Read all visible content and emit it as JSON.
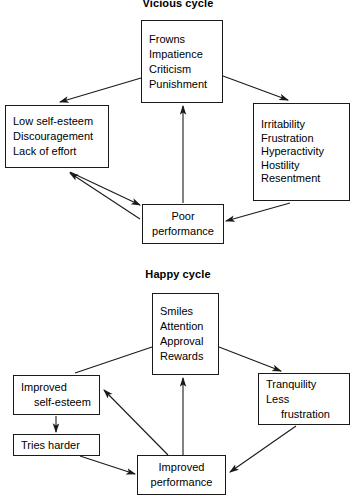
{
  "page": {
    "width": 356,
    "height": 498,
    "background": "#ffffff",
    "stroke_color": "#1a1a1a",
    "text_color": "#000000"
  },
  "diagrams": [
    {
      "id": "vicious-cycle",
      "title": "Vicious cycle",
      "title_x": 178,
      "title_y": -3,
      "nodes": [
        {
          "id": "vc-top",
          "name": "vicious-top-box",
          "x": 141,
          "y": 20,
          "w": 82,
          "h": 83,
          "align": "left",
          "lines": [
            "Frowns",
            "Impatience",
            "Criticism",
            "Punishment"
          ]
        },
        {
          "id": "vc-left",
          "name": "vicious-left-box",
          "x": 5,
          "y": 105,
          "w": 104,
          "h": 63,
          "align": "left",
          "lines": [
            "Low self-esteem",
            "Discouragement",
            "Lack of effort"
          ]
        },
        {
          "id": "vc-right",
          "name": "vicious-right-box",
          "x": 253,
          "y": 103,
          "w": 97,
          "h": 98,
          "align": "left",
          "lines": [
            "Irritability",
            "Frustration",
            "Hyperactivity",
            "Hostility",
            "Resentment"
          ]
        },
        {
          "id": "vc-bottom",
          "name": "vicious-bottom-box",
          "x": 142,
          "y": 204,
          "w": 82,
          "h": 40,
          "align": "center",
          "lines": [
            "Poor",
            "performance"
          ]
        }
      ],
      "edges": [
        {
          "name": "arrow-top-to-left",
          "from": "vc-top",
          "to": "vc-left",
          "x1": 141,
          "y1": 78,
          "x2": 60,
          "y2": 102,
          "heads": "end"
        },
        {
          "name": "arrow-top-to-right",
          "from": "vc-top",
          "to": "vc-right",
          "x1": 223,
          "y1": 76,
          "x2": 288,
          "y2": 100,
          "heads": "end"
        },
        {
          "name": "arrow-left-performance-double",
          "from": "vc-left",
          "to": "vc-bottom",
          "x1": 70,
          "y1": 172,
          "x2": 140,
          "y2": 205,
          "heads": "end"
        },
        {
          "name": "arrow-performance-to-left",
          "from": "vc-bottom",
          "to": "vc-left",
          "x1": 140,
          "y1": 219,
          "x2": 70,
          "y2": 173,
          "heads": "end"
        },
        {
          "name": "arrow-right-to-performance",
          "from": "vc-right",
          "to": "vc-bottom",
          "x1": 290,
          "y1": 203,
          "x2": 226,
          "y2": 221,
          "heads": "end"
        },
        {
          "name": "arrow-performance-to-top",
          "from": "vc-bottom",
          "to": "vc-top",
          "x1": 183,
          "y1": 203,
          "x2": 183,
          "y2": 106,
          "heads": "end"
        }
      ]
    },
    {
      "id": "happy-cycle",
      "title": "Happy cycle",
      "title_x": 178,
      "title_y": 268,
      "nodes": [
        {
          "id": "hc-top",
          "name": "happy-top-box",
          "x": 152,
          "y": 293,
          "w": 67,
          "h": 82,
          "align": "left",
          "lines": [
            "Smiles",
            "Attention",
            "Approval",
            "Rewards"
          ]
        },
        {
          "id": "hc-left",
          "name": "happy-improved-self-esteem-box",
          "x": 13,
          "y": 375,
          "w": 87,
          "h": 40,
          "align": "left",
          "lines": [
            "Improved",
            "self-esteem"
          ],
          "indents": [
            0,
            1
          ]
        },
        {
          "id": "hc-left2",
          "name": "happy-tries-harder-box",
          "x": 13,
          "y": 434,
          "w": 87,
          "h": 22,
          "align": "left",
          "lines": [
            "Tries harder"
          ]
        },
        {
          "id": "hc-right",
          "name": "happy-tranquility-box",
          "x": 258,
          "y": 373,
          "w": 92,
          "h": 52,
          "align": "left",
          "lines": [
            "Tranquility",
            "Less",
            "frustration"
          ],
          "indents": [
            0,
            0,
            2
          ]
        },
        {
          "id": "hc-bottom",
          "name": "happy-improved-performance-box",
          "x": 137,
          "y": 455,
          "w": 89,
          "h": 40,
          "align": "center",
          "lines": [
            "Improved",
            "performance"
          ]
        }
      ],
      "edges": [
        {
          "name": "arrow-happy-top-to-left",
          "from": "hc-top",
          "to": "hc-left",
          "x1": 152,
          "y1": 347,
          "x2": 75,
          "y2": 373,
          "heads": "none"
        },
        {
          "name": "arrow-happy-top-to-right",
          "from": "hc-top",
          "to": "hc-right",
          "x1": 219,
          "y1": 347,
          "x2": 281,
          "y2": 371,
          "heads": "end"
        },
        {
          "name": "arrow-tries-harder-to-performance",
          "from": "hc-left2",
          "to": "hc-bottom",
          "x1": 80,
          "y1": 456,
          "x2": 135,
          "y2": 474,
          "heads": "end"
        },
        {
          "name": "arrow-tranquility-to-performance",
          "from": "hc-right",
          "to": "hc-bottom",
          "x1": 296,
          "y1": 426,
          "x2": 230,
          "y2": 472,
          "heads": "end"
        },
        {
          "name": "arrow-performance-to-self-esteem",
          "from": "hc-bottom",
          "to": "hc-left",
          "x1": 168,
          "y1": 455,
          "x2": 104,
          "y2": 390,
          "heads": "end"
        },
        {
          "name": "arrow-performance-to-top",
          "from": "hc-bottom",
          "to": "hc-top",
          "x1": 183,
          "y1": 455,
          "x2": 183,
          "y2": 378,
          "heads": "end"
        },
        {
          "name": "arrow-self-esteem-to-tries-harder",
          "from": "hc-left",
          "to": "hc-left2",
          "x1": 56,
          "y1": 416,
          "x2": 56,
          "y2": 432,
          "heads": "end"
        }
      ]
    }
  ]
}
